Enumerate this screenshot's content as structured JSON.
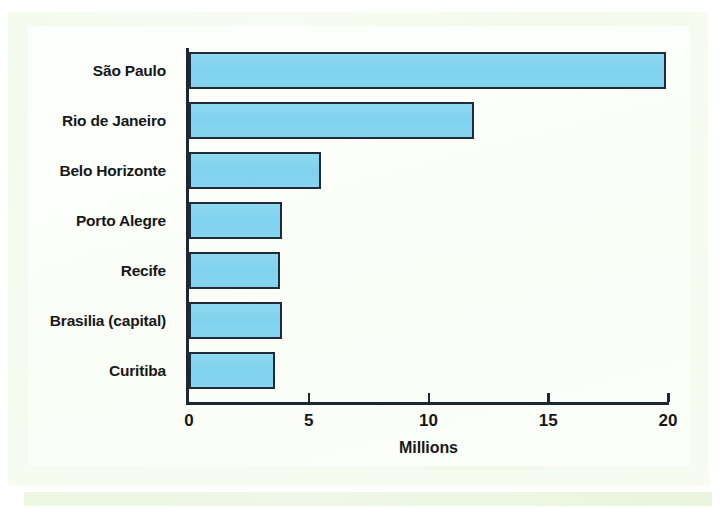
{
  "figure": {
    "background_color": "#f2fbec",
    "plot_background_color": "#fdfffb"
  },
  "chart_data": {
    "type": "bar",
    "orientation": "horizontal",
    "title": "",
    "subtitle": "",
    "xlabel": "Millions",
    "ylabel": "",
    "categories": [
      "São Paulo",
      "Rio de Janeiro",
      "Belo Horizonte",
      "Porto Alegre",
      "Recife",
      "Brasilia (capital)",
      "Curitiba"
    ],
    "values": [
      19.9,
      11.9,
      5.5,
      3.9,
      3.8,
      3.9,
      3.6
    ],
    "xlim": [
      0,
      20
    ],
    "ylim": null,
    "xticks": [
      0,
      5,
      10,
      15,
      20
    ],
    "xtick_labels": [
      "0",
      "5",
      "10",
      "15",
      "20"
    ],
    "grid": false,
    "legend": null,
    "legend_position": "none",
    "annotations": [],
    "bar_fill_color": "#82d3ef",
    "bar_edge_color": "#202b3a",
    "units": "millions of people"
  },
  "axis": {
    "x_title": "Millions",
    "tick_labels": [
      "0",
      "5",
      "10",
      "15",
      "20"
    ]
  },
  "bars": [
    {
      "label": "São Paulo",
      "value": 19.9
    },
    {
      "label": "Rio de Janeiro",
      "value": 11.9
    },
    {
      "label": "Belo Horizonte",
      "value": 5.5
    },
    {
      "label": "Porto Alegre",
      "value": 3.9
    },
    {
      "label": "Recife",
      "value": 3.8
    },
    {
      "label": "Brasilia (capital)",
      "value": 3.9
    },
    {
      "label": "Curitiba",
      "value": 3.6
    }
  ]
}
